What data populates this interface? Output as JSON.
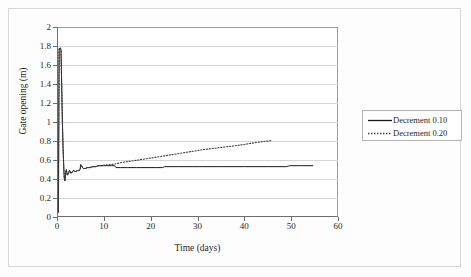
{
  "chart_data": {
    "type": "line",
    "title": "",
    "xlabel": "Time (days)",
    "ylabel": "Gate opening (m)",
    "xlim": [
      0,
      60
    ],
    "ylim": [
      0,
      2
    ],
    "xticks": [
      "0",
      "10",
      "20",
      "30",
      "40",
      "50",
      "60"
    ],
    "xtick_values": [
      0,
      10,
      20,
      30,
      40,
      50,
      60
    ],
    "yticks": [
      "0",
      "0.2",
      "0.4",
      "0.6",
      "0.8",
      "1",
      "1.2",
      "1.4",
      "1.6",
      "1.8",
      "2"
    ],
    "ytick_values": [
      0,
      0.2,
      0.4,
      0.6,
      0.8,
      1,
      1.2,
      1.4,
      1.6,
      1.8,
      2
    ],
    "grid": "horizontal",
    "legend_position": "right-outside",
    "series": [
      {
        "name": "Decrement 0.10",
        "style": "solid",
        "color": "#1a1a1a",
        "points": [
          [
            0.3,
            0.05
          ],
          [
            0.45,
            1.77
          ],
          [
            0.7,
            1.78
          ],
          [
            0.85,
            1.76
          ],
          [
            1.0,
            1.4
          ],
          [
            1.15,
            1.0
          ],
          [
            1.3,
            0.72
          ],
          [
            1.45,
            0.52
          ],
          [
            1.55,
            0.41
          ],
          [
            1.7,
            0.38
          ],
          [
            1.85,
            0.47
          ],
          [
            2.0,
            0.5
          ],
          [
            2.2,
            0.44
          ],
          [
            2.45,
            0.46
          ],
          [
            2.7,
            0.49
          ],
          [
            2.95,
            0.46
          ],
          [
            3.2,
            0.47
          ],
          [
            3.5,
            0.49
          ],
          [
            3.8,
            0.48
          ],
          [
            4.1,
            0.48
          ],
          [
            4.4,
            0.49
          ],
          [
            4.7,
            0.49
          ],
          [
            4.95,
            0.5
          ],
          [
            5.05,
            0.55
          ],
          [
            5.25,
            0.54
          ],
          [
            5.6,
            0.51
          ],
          [
            6.0,
            0.51
          ],
          [
            6.5,
            0.52
          ],
          [
            7.0,
            0.52
          ],
          [
            7.6,
            0.53
          ],
          [
            8.2,
            0.53
          ],
          [
            8.8,
            0.54
          ],
          [
            9.4,
            0.54
          ],
          [
            10.0,
            0.54
          ],
          [
            10.8,
            0.54
          ],
          [
            11.6,
            0.54
          ],
          [
            12.3,
            0.54
          ],
          [
            12.6,
            0.52
          ],
          [
            13.5,
            0.52
          ],
          [
            15.0,
            0.52
          ],
          [
            17.0,
            0.52
          ],
          [
            19.0,
            0.52
          ],
          [
            21.0,
            0.52
          ],
          [
            22.5,
            0.52
          ],
          [
            23.0,
            0.53
          ],
          [
            26.0,
            0.53
          ],
          [
            29.0,
            0.53
          ],
          [
            30.5,
            0.53
          ],
          [
            31.0,
            0.53
          ],
          [
            35.0,
            0.53
          ],
          [
            40.0,
            0.53
          ],
          [
            45.0,
            0.53
          ],
          [
            49.0,
            0.53
          ],
          [
            49.6,
            0.54
          ],
          [
            52.0,
            0.54
          ],
          [
            54.6,
            0.54
          ]
        ]
      },
      {
        "name": "Decrement 0.20",
        "style": "dotted",
        "color": "#3a3a3a",
        "points": [
          [
            0.3,
            0.05
          ],
          [
            0.45,
            1.77
          ],
          [
            0.7,
            1.78
          ],
          [
            0.85,
            1.76
          ],
          [
            1.0,
            1.4
          ],
          [
            1.15,
            1.0
          ],
          [
            1.3,
            0.72
          ],
          [
            1.45,
            0.52
          ],
          [
            1.55,
            0.41
          ],
          [
            1.7,
            0.38
          ],
          [
            1.85,
            0.47
          ],
          [
            2.0,
            0.5
          ],
          [
            2.2,
            0.44
          ],
          [
            2.45,
            0.46
          ],
          [
            2.7,
            0.49
          ],
          [
            2.95,
            0.46
          ],
          [
            3.2,
            0.47
          ],
          [
            3.5,
            0.49
          ],
          [
            3.8,
            0.48
          ],
          [
            4.1,
            0.48
          ],
          [
            4.4,
            0.49
          ],
          [
            4.7,
            0.49
          ],
          [
            4.95,
            0.5
          ],
          [
            5.05,
            0.55
          ],
          [
            5.25,
            0.54
          ],
          [
            5.6,
            0.51
          ],
          [
            6.0,
            0.51
          ],
          [
            6.5,
            0.52
          ],
          [
            7.0,
            0.52
          ],
          [
            7.6,
            0.53
          ],
          [
            8.2,
            0.53
          ],
          [
            8.8,
            0.54
          ],
          [
            9.4,
            0.54
          ],
          [
            10.0,
            0.545
          ],
          [
            11.0,
            0.55
          ],
          [
            12.0,
            0.555
          ],
          [
            13.0,
            0.565
          ],
          [
            14.0,
            0.575
          ],
          [
            15.0,
            0.583
          ],
          [
            16.0,
            0.59
          ],
          [
            17.0,
            0.597
          ],
          [
            18.0,
            0.605
          ],
          [
            19.0,
            0.613
          ],
          [
            20.0,
            0.62
          ],
          [
            21.0,
            0.628
          ],
          [
            22.0,
            0.636
          ],
          [
            23.0,
            0.644
          ],
          [
            24.0,
            0.652
          ],
          [
            25.0,
            0.66
          ],
          [
            26.0,
            0.668
          ],
          [
            27.0,
            0.676
          ],
          [
            28.0,
            0.684
          ],
          [
            29.0,
            0.692
          ],
          [
            30.0,
            0.7
          ],
          [
            31.0,
            0.708
          ],
          [
            32.0,
            0.714
          ],
          [
            33.0,
            0.72
          ],
          [
            34.0,
            0.726
          ],
          [
            35.0,
            0.732
          ],
          [
            36.0,
            0.738
          ],
          [
            37.0,
            0.744
          ],
          [
            38.0,
            0.75
          ],
          [
            39.0,
            0.757
          ],
          [
            40.0,
            0.764
          ],
          [
            41.0,
            0.772
          ],
          [
            42.0,
            0.78
          ],
          [
            43.0,
            0.788
          ],
          [
            44.0,
            0.794
          ],
          [
            45.0,
            0.8
          ],
          [
            45.8,
            0.803
          ]
        ]
      }
    ]
  },
  "legend": {
    "items": [
      {
        "label": "Decrement 0.10",
        "style": "solid"
      },
      {
        "label": "Decrement 0.20",
        "style": "dotted"
      }
    ]
  }
}
